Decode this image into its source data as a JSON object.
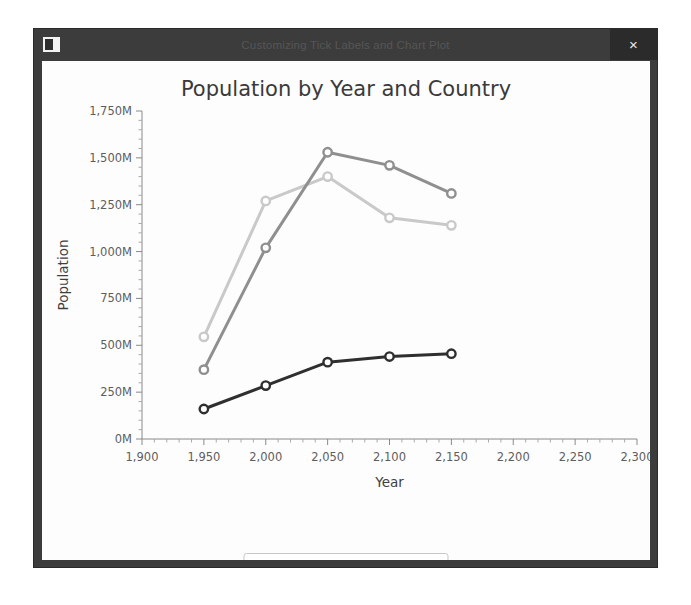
{
  "window": {
    "title": "Customizing Tick Labels and Chart Plot",
    "app_icon": "window-app-icon",
    "close_label": "×"
  },
  "chart_data": {
    "type": "line",
    "title": "Population by Year and Country",
    "xlabel": "Year",
    "ylabel": "Population",
    "x": [
      1950,
      2000,
      2050,
      2100,
      2150
    ],
    "xlim": [
      1900,
      2300
    ],
    "ylim": [
      0,
      1750
    ],
    "xticks": [
      "1,900",
      "1,950",
      "2,000",
      "2,050",
      "2,100",
      "2,150",
      "2,200",
      "2,250",
      "2,300"
    ],
    "xtick_values": [
      1900,
      1950,
      2000,
      2050,
      2100,
      2150,
      2200,
      2250,
      2300
    ],
    "yticks": [
      "0M",
      "250M",
      "500M",
      "750M",
      "1,000M",
      "1,250M",
      "1,500M",
      "1,750M"
    ],
    "ytick_values": [
      0,
      250,
      500,
      750,
      1000,
      1250,
      1500,
      1750
    ],
    "grid": false,
    "legend_position": "bottom",
    "series": [
      {
        "name": "China",
        "color": "#c9c9c9",
        "values": [
          545,
          1270,
          1400,
          1180,
          1140
        ]
      },
      {
        "name": "India",
        "color": "#8f8f8f",
        "values": [
          370,
          1020,
          1530,
          1460,
          1310
        ]
      },
      {
        "name": "USA",
        "color": "#2f2f2f",
        "values": [
          160,
          285,
          410,
          440,
          455
        ]
      }
    ]
  },
  "legend": {
    "items": [
      {
        "label": "China",
        "color": "#c9c9c9"
      },
      {
        "label": "India",
        "color": "#8f8f8f"
      },
      {
        "label": "USA",
        "color": "#2f2f2f"
      }
    ]
  }
}
